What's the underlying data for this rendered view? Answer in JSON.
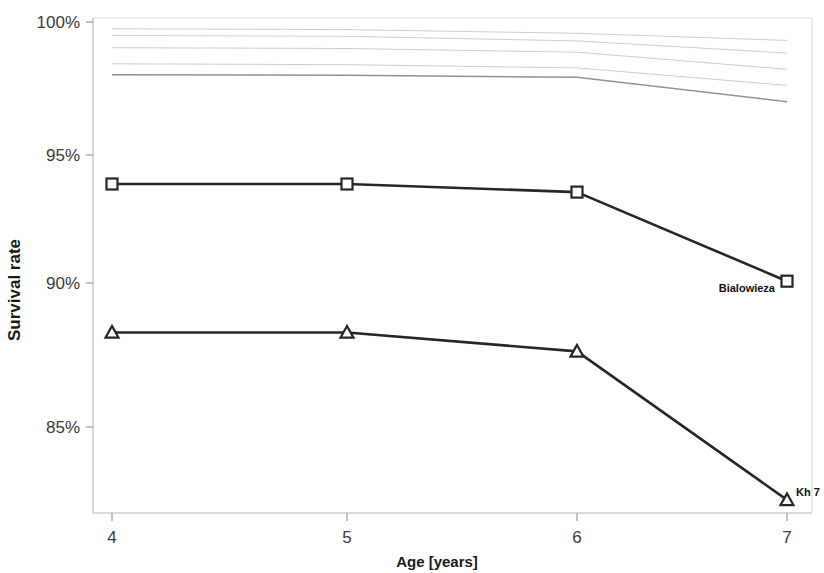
{
  "chart_data": {
    "type": "line",
    "title": "",
    "xlabel": "Age [years]",
    "ylabel": "Survival rate",
    "x": [
      4,
      5,
      6,
      7
    ],
    "xticklabels": [
      "4",
      "5",
      "6",
      "7"
    ],
    "yticklabels": [
      "100%",
      "95%",
      "90%",
      "85%"
    ],
    "yticks": [
      100,
      95,
      90,
      85
    ],
    "ylim": [
      82,
      100.6
    ],
    "xlim": [
      3.92,
      7.05
    ],
    "grid": false,
    "legend": "inline-endpoint-labels",
    "series": [
      {
        "name": "Bialowieza",
        "marker": "square",
        "style": "solid-bold",
        "label_x": 7,
        "values": [
          94.0,
          94.0,
          93.7,
          90.4
        ]
      },
      {
        "name": "Kh 7",
        "marker": "triangle",
        "style": "solid-bold",
        "label_x": 7,
        "values": [
          88.5,
          88.5,
          87.8,
          82.3
        ]
      },
      {
        "name": "faint-1",
        "marker": "none",
        "style": "faint",
        "values": [
          99.75,
          99.72,
          99.58,
          99.32
        ]
      },
      {
        "name": "faint-2",
        "marker": "none",
        "style": "faint",
        "values": [
          99.5,
          99.47,
          99.3,
          98.85
        ]
      },
      {
        "name": "faint-3",
        "marker": "none",
        "style": "faint",
        "values": [
          99.05,
          99.02,
          98.88,
          98.25
        ]
      },
      {
        "name": "faint-4",
        "marker": "none",
        "style": "faint",
        "values": [
          98.45,
          98.42,
          98.3,
          97.65
        ]
      },
      {
        "name": "faint-5",
        "marker": "none",
        "style": "faint-strong",
        "values": [
          98.05,
          98.03,
          97.95,
          97.05
        ]
      }
    ]
  },
  "axis": {
    "y_title": "Survival rate",
    "x_title": "Age [years]",
    "y_tick_0": "100%",
    "y_tick_1": "95%",
    "y_tick_2": "90%",
    "y_tick_3": "85%",
    "x_tick_0": "4",
    "x_tick_1": "5",
    "x_tick_2": "6",
    "x_tick_3": "7"
  },
  "annotations": {
    "series_a_label": "Bialowieza",
    "series_b_label": "Kh 7"
  },
  "colors": {
    "line": "#262626",
    "faint": "#9b9b9b",
    "axis": "#b9b9b9",
    "text": "#1a1a1a",
    "background": "#ffffff"
  }
}
